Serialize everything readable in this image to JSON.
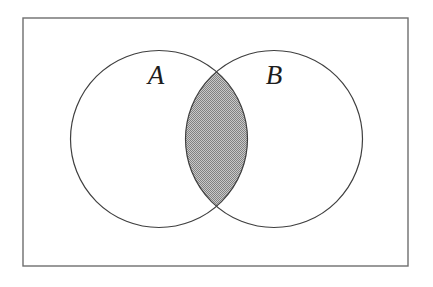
{
  "figure": {
    "kind": "venn-diagram",
    "width": 433,
    "height": 287,
    "background_color": "#ffffff"
  },
  "universe": {
    "name": "universal-set-rectangle",
    "x": 23,
    "y": 18,
    "width": 385,
    "height": 248,
    "stroke_color": "#6e6e6e",
    "stroke_width": 1.4,
    "fill_color": "#ffffff"
  },
  "sets": [
    {
      "id": "A",
      "label": "A",
      "cx": 159,
      "cy": 139,
      "r": 88.5,
      "stroke_color": "#3f3f3f",
      "stroke_width": 1.2,
      "fill_color": "#ffffff",
      "label_x": 156,
      "label_y": 84
    },
    {
      "id": "B",
      "label": "B",
      "cx": 274,
      "cy": 139,
      "r": 88.5,
      "stroke_color": "#3f3f3f",
      "stroke_width": 1.2,
      "fill_color": "#ffffff",
      "label_x": 274,
      "label_y": 84
    }
  ],
  "intersection": {
    "name": "intersection-region",
    "shaded": true,
    "fill_color": "#a5a5a5",
    "texture": "halftone-dither",
    "top_crossing_x": 217,
    "top_crossing_y": 76,
    "bottom_crossing_x": 217,
    "bottom_crossing_y": 202,
    "left_extent_x": 185,
    "right_extent_x": 248
  }
}
